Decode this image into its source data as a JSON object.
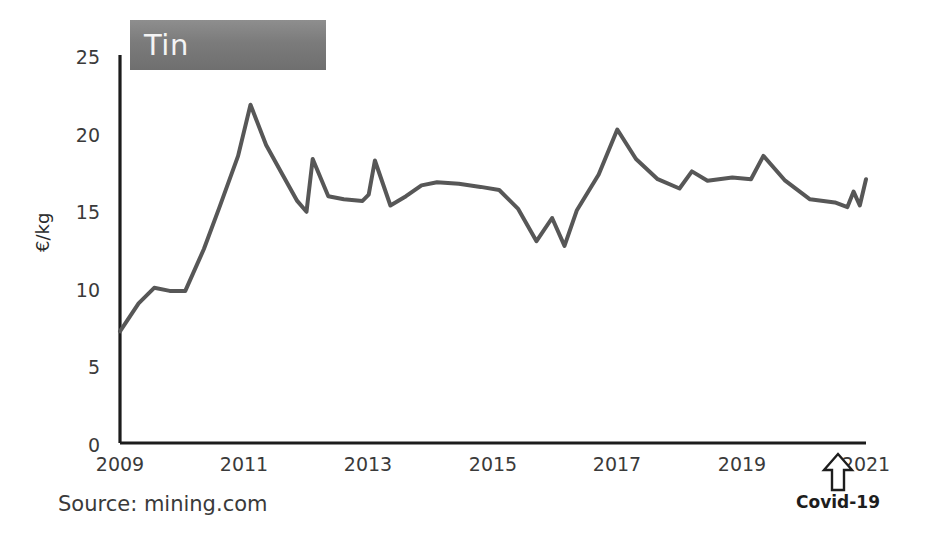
{
  "chart_data": {
    "type": "line",
    "title": "Tin",
    "xlabel": "",
    "ylabel": "€/kg",
    "xlim": [
      2009,
      2021
    ],
    "ylim": [
      0,
      25
    ],
    "grid": false,
    "legend_position": "top-left-badge",
    "y_ticks": [
      "0",
      "5",
      "10",
      "15",
      "20",
      "25"
    ],
    "y_tick_values": [
      0,
      5,
      10,
      15,
      20,
      25
    ],
    "x_ticks": [
      "2009",
      "2011",
      "2013",
      "2015",
      "2017",
      "2019",
      "2021"
    ],
    "x_tick_values": [
      2009,
      2011,
      2013,
      2015,
      2017,
      2019,
      2021
    ],
    "series": [
      {
        "name": "Tin",
        "color": "#575757",
        "x": [
          2009.0,
          2009.3,
          2009.55,
          2009.8,
          2010.05,
          2010.35,
          2010.6,
          2010.9,
          2011.1,
          2011.35,
          2011.6,
          2011.85,
          2012.0,
          2012.1,
          2012.35,
          2012.6,
          2012.9,
          2013.0,
          2013.1,
          2013.35,
          2013.6,
          2013.85,
          2014.1,
          2014.45,
          2014.8,
          2015.1,
          2015.4,
          2015.7,
          2015.95,
          2016.15,
          2016.35,
          2016.7,
          2017.0,
          2017.3,
          2017.65,
          2018.0,
          2018.2,
          2018.45,
          2018.85,
          2019.15,
          2019.35,
          2019.7,
          2020.1,
          2020.5,
          2020.7,
          2020.8,
          2020.9,
          2021.0
        ],
        "y": [
          7.2,
          9.0,
          10.0,
          9.8,
          9.8,
          12.5,
          15.2,
          18.5,
          21.8,
          19.2,
          17.4,
          15.6,
          14.9,
          18.3,
          15.9,
          15.7,
          15.6,
          16.0,
          18.2,
          15.3,
          15.9,
          16.6,
          16.8,
          16.7,
          16.5,
          16.3,
          15.1,
          13.0,
          14.5,
          12.7,
          15.0,
          17.3,
          20.2,
          18.3,
          17.0,
          16.4,
          17.5,
          16.9,
          17.1,
          17.0,
          18.5,
          16.9,
          15.7,
          15.5,
          15.2,
          16.2,
          15.3,
          17.0
        ]
      }
    ],
    "annotations": [
      {
        "name": "covid-19",
        "label": "Covid-19",
        "icon": "up-arrow-icon",
        "x": 2020.55
      }
    ],
    "source": "Source: mining.com"
  }
}
